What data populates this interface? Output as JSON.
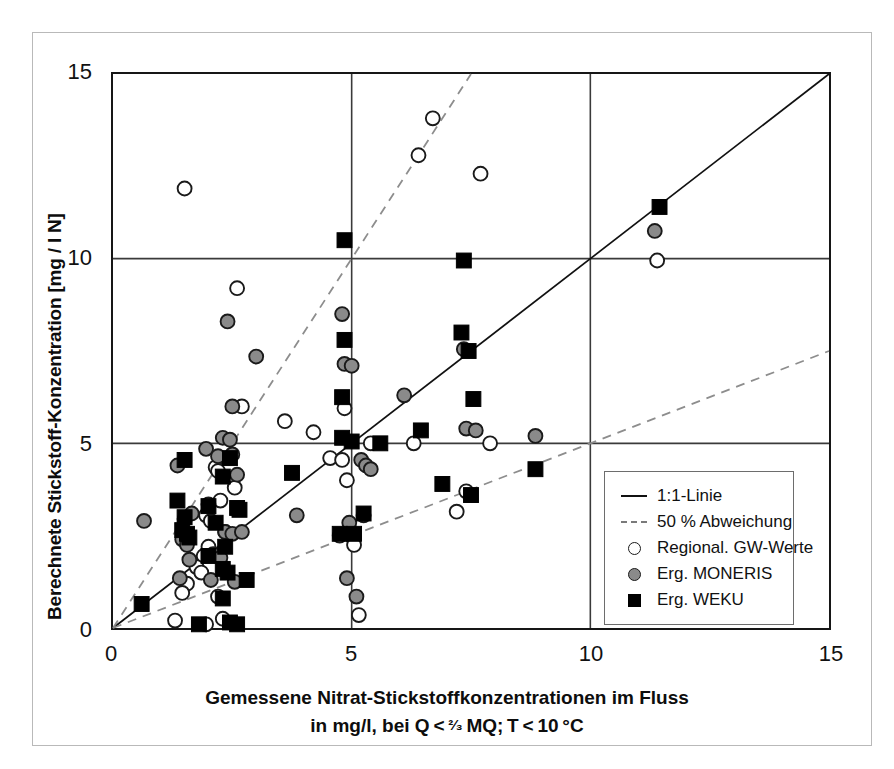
{
  "chart_data": {
    "type": "scatter",
    "title": "",
    "xlabel": "Gemessene Nitrat-Stickstoffkonzentrationen im Fluss",
    "xlabel_line2": "in mg/l, bei Q < ²⁄₃ MQ; T < 10 °C",
    "ylabel": "Berechnete Stickstoff-Konzentration [mg / l N]",
    "xlim": [
      0,
      15
    ],
    "ylim": [
      0,
      15
    ],
    "xticks": [
      "0",
      "5",
      "10",
      "15"
    ],
    "yticks": [
      "0",
      "5",
      "10",
      "15"
    ],
    "xtick_values": [
      0,
      5,
      10,
      15
    ],
    "ytick_values": [
      0,
      5,
      10,
      15
    ],
    "grid": true,
    "legend_position": "lower-right-inside",
    "reference_lines": [
      {
        "name": "1:1-Linie",
        "style": "solid",
        "slope": 1.0,
        "intercept": 0
      },
      {
        "name": "50 % Abweichung oben",
        "style": "dashed",
        "slope": 2.0,
        "intercept": 0
      },
      {
        "name": "50 % Abweichung unten",
        "style": "dashed",
        "slope": 0.5,
        "intercept": 0
      }
    ],
    "series": [
      {
        "name": "Regional. GW-Werte",
        "marker": "open-circle",
        "color": "#ffffff",
        "edge_color": "#1a1a1a",
        "points": [
          [
            1.5,
            11.9
          ],
          [
            6.7,
            13.8
          ],
          [
            6.4,
            12.8
          ],
          [
            7.7,
            12.3
          ],
          [
            11.4,
            9.95
          ],
          [
            2.6,
            9.2
          ],
          [
            2.7,
            6.0
          ],
          [
            3.6,
            5.6
          ],
          [
            4.2,
            5.3
          ],
          [
            4.85,
            5.95
          ],
          [
            5.4,
            5.0
          ],
          [
            4.55,
            4.6
          ],
          [
            4.8,
            4.55
          ],
          [
            6.3,
            5.0
          ],
          [
            7.9,
            5.0
          ],
          [
            4.9,
            4.0
          ],
          [
            2.15,
            4.35
          ],
          [
            2.2,
            4.25
          ],
          [
            7.4,
            3.7
          ],
          [
            7.2,
            3.15
          ],
          [
            2.55,
            3.8
          ],
          [
            2.25,
            3.45
          ],
          [
            1.95,
            3.05
          ],
          [
            2.05,
            2.9
          ],
          [
            2.35,
            2.6
          ],
          [
            4.75,
            2.5
          ],
          [
            5.05,
            2.25
          ],
          [
            2.0,
            2.2
          ],
          [
            1.9,
            1.95
          ],
          [
            1.75,
            1.65
          ],
          [
            1.85,
            1.5
          ],
          [
            1.55,
            1.2
          ],
          [
            1.45,
            0.95
          ],
          [
            2.2,
            0.85
          ],
          [
            1.3,
            0.2
          ],
          [
            2.3,
            0.25
          ],
          [
            1.95,
            0.1
          ],
          [
            5.15,
            0.35
          ]
        ]
      },
      {
        "name": "Erg. MONERIS",
        "marker": "gray-circle",
        "color": "#8a8a8a",
        "edge_color": "#1a1a1a",
        "points": [
          [
            2.4,
            8.3
          ],
          [
            4.8,
            8.5
          ],
          [
            3.0,
            7.35
          ],
          [
            4.85,
            7.15
          ],
          [
            5.0,
            7.1
          ],
          [
            7.35,
            7.55
          ],
          [
            11.35,
            10.75
          ],
          [
            2.5,
            6.0
          ],
          [
            2.3,
            5.15
          ],
          [
            2.45,
            5.1
          ],
          [
            6.1,
            6.3
          ],
          [
            7.4,
            5.4
          ],
          [
            7.6,
            5.35
          ],
          [
            8.85,
            5.2
          ],
          [
            1.95,
            4.85
          ],
          [
            2.2,
            4.65
          ],
          [
            2.5,
            4.7
          ],
          [
            1.35,
            4.4
          ],
          [
            2.6,
            4.15
          ],
          [
            5.2,
            4.55
          ],
          [
            5.3,
            4.4
          ],
          [
            5.4,
            4.3
          ],
          [
            5.25,
            3.05
          ],
          [
            0.65,
            2.9
          ],
          [
            1.5,
            2.95
          ],
          [
            1.65,
            3.1
          ],
          [
            2.0,
            3.35
          ],
          [
            3.85,
            3.05
          ],
          [
            4.95,
            2.85
          ],
          [
            1.45,
            2.4
          ],
          [
            1.55,
            2.25
          ],
          [
            2.35,
            2.6
          ],
          [
            2.5,
            2.55
          ],
          [
            2.7,
            2.6
          ],
          [
            1.6,
            1.85
          ],
          [
            2.1,
            2.0
          ],
          [
            2.25,
            1.9
          ],
          [
            1.4,
            1.35
          ],
          [
            2.05,
            1.3
          ],
          [
            2.55,
            1.25
          ],
          [
            4.9,
            1.35
          ],
          [
            5.1,
            0.85
          ]
        ]
      },
      {
        "name": "Erg. WEKU",
        "marker": "black-square",
        "color": "#000000",
        "edge_color": "#000000",
        "points": [
          [
            4.85,
            10.5
          ],
          [
            7.35,
            9.95
          ],
          [
            11.45,
            11.4
          ],
          [
            4.85,
            7.8
          ],
          [
            7.3,
            8.0
          ],
          [
            7.45,
            7.5
          ],
          [
            7.55,
            6.2
          ],
          [
            4.8,
            6.25
          ],
          [
            4.8,
            5.15
          ],
          [
            5.0,
            5.05
          ],
          [
            5.6,
            5.0
          ],
          [
            6.45,
            5.35
          ],
          [
            1.5,
            4.55
          ],
          [
            2.45,
            4.6
          ],
          [
            3.75,
            4.2
          ],
          [
            2.3,
            4.1
          ],
          [
            8.85,
            4.3
          ],
          [
            7.5,
            3.6
          ],
          [
            6.9,
            3.9
          ],
          [
            5.25,
            3.1
          ],
          [
            1.35,
            3.45
          ],
          [
            1.5,
            3.0
          ],
          [
            2.0,
            3.3
          ],
          [
            2.6,
            3.25
          ],
          [
            2.65,
            3.2
          ],
          [
            2.15,
            2.85
          ],
          [
            1.45,
            2.65
          ],
          [
            1.55,
            2.55
          ],
          [
            1.6,
            2.45
          ],
          [
            4.75,
            2.55
          ],
          [
            5.05,
            2.55
          ],
          [
            2.35,
            2.2
          ],
          [
            2.0,
            1.95
          ],
          [
            2.3,
            1.6
          ],
          [
            2.4,
            1.5
          ],
          [
            2.8,
            1.3
          ],
          [
            0.6,
            0.65
          ],
          [
            2.3,
            0.8
          ],
          [
            2.45,
            0.15
          ],
          [
            2.6,
            0.1
          ],
          [
            1.8,
            0.1
          ]
        ]
      }
    ],
    "legend_entries": [
      {
        "label": "1:1-Linie",
        "key": "solid-line"
      },
      {
        "label": "50 % Abweichung",
        "key": "dashed-line"
      },
      {
        "label": "Regional. GW-Werte",
        "key": "open-circle"
      },
      {
        "label": "Erg. MONERIS",
        "key": "gray-circle"
      },
      {
        "label": "Erg. WEKU",
        "key": "black-square"
      }
    ]
  }
}
